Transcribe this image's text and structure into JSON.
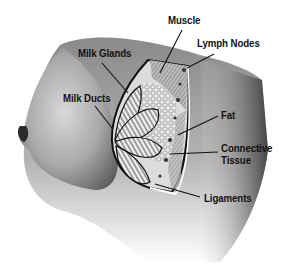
{
  "diagram": {
    "type": "anatomical-illustration",
    "background": "#ffffff",
    "ink_color": "#111111",
    "labels": [
      {
        "id": "muscle",
        "text": "Muscle",
        "x": 168,
        "y": 15,
        "leader": {
          "x1": 182,
          "y1": 30,
          "x2": 160,
          "y2": 73
        }
      },
      {
        "id": "lymph-nodes",
        "text": "Lymph Nodes",
        "x": 197,
        "y": 38,
        "leader": {
          "x1": 214,
          "y1": 54,
          "x2": 187,
          "y2": 68
        }
      },
      {
        "id": "milk-glands",
        "text": "Milk Glands",
        "x": 78,
        "y": 48,
        "leader": {
          "x1": 102,
          "y1": 63,
          "x2": 128,
          "y2": 93
        }
      },
      {
        "id": "milk-ducts",
        "text": "Milk Ducts",
        "x": 63,
        "y": 93,
        "leader": {
          "x1": 95,
          "y1": 106,
          "x2": 112,
          "y2": 128
        }
      },
      {
        "id": "fat",
        "text": "Fat",
        "x": 221,
        "y": 110,
        "leader": {
          "x1": 218,
          "y1": 116,
          "x2": 178,
          "y2": 135
        }
      },
      {
        "id": "connective-tissue",
        "text": "Connective",
        "text2": "Tissue",
        "x": 221,
        "y": 143,
        "leader": {
          "x1": 218,
          "y1": 152,
          "x2": 170,
          "y2": 154
        }
      },
      {
        "id": "ligaments",
        "text": "Ligaments",
        "x": 204,
        "y": 193,
        "leader": {
          "x1": 200,
          "y1": 197,
          "x2": 155,
          "y2": 184
        }
      }
    ]
  }
}
